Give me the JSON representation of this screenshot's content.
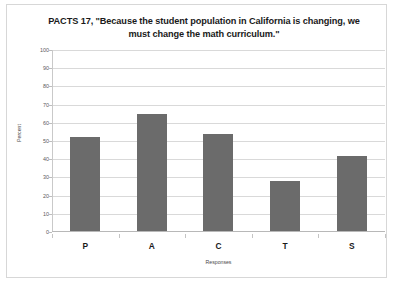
{
  "chart_data": {
    "type": "bar",
    "title": "PACTS 17, \"Because the student population in California is changing, we must change the math curriculum.\"",
    "title_line1": "PACTS 17, \"Because the student population in California is changing, we",
    "title_line2": "must change the math curriculum.\"",
    "categories": [
      "P",
      "A",
      "C",
      "T",
      "S"
    ],
    "values": [
      52,
      65,
      54,
      28,
      42
    ],
    "series": [
      {
        "name": "Percent",
        "values": [
          52,
          65,
          54,
          28,
          42
        ]
      }
    ],
    "xlabel": "Responses",
    "ylabel": "Percent",
    "ylim": [
      0,
      100
    ],
    "ytick_step": 10,
    "yticks": [
      100,
      90,
      80,
      70,
      60,
      50,
      40,
      30,
      20,
      10,
      0
    ],
    "grid": true,
    "legend": false,
    "legend_position": "none",
    "bar_color": "#6b6b6b",
    "gridline_color": "#d9d9d9",
    "background_color": "#ffffff",
    "frame_color": "#d7d7d7"
  }
}
